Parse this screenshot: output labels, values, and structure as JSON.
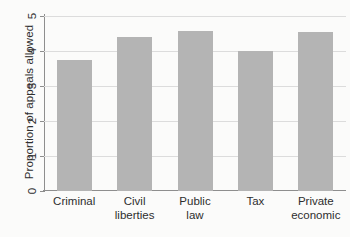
{
  "chart_data": {
    "type": "bar",
    "title": "",
    "xlabel": "",
    "ylabel": "Proportion of appeals allowed",
    "categories": [
      "Criminal",
      "Civil liberties",
      "Public law",
      "Tax",
      "Private economic"
    ],
    "category_lines": [
      [
        "Criminal"
      ],
      [
        "Civil",
        "liberties"
      ],
      [
        "Public",
        "law"
      ],
      [
        "Tax"
      ],
      [
        "Private",
        "economic"
      ]
    ],
    "values": [
      3.74,
      4.39,
      4.57,
      3.99,
      4.54
    ],
    "ylim": [
      0,
      5
    ],
    "yticks": [
      0,
      1,
      2,
      3,
      4,
      5
    ],
    "ytick_labels": [
      "0",
      "1",
      "2",
      "3",
      "4",
      "5"
    ],
    "grid": true,
    "grid_axis": "y",
    "legend": "none",
    "bar_color": "#b4b4b4",
    "grid_color": "#dcdcdc",
    "axis_color": "#8e8e8e",
    "background_color": "#fbfbfa"
  }
}
